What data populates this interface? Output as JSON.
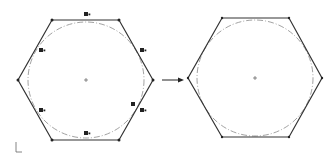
{
  "diagram": {
    "description": "Sketch: hexagon with inscribed construction circle and relation markers, arrow, resulting hexagon",
    "colors": {
      "edge": "#333333",
      "construction_circle": "#888888",
      "vertex": "#222222",
      "marker": "#222222"
    },
    "left_sketch": {
      "label": "Sketch with relations shown",
      "center": [
        86,
        80
      ],
      "vertices": [
        [
          52,
          20
        ],
        [
          119,
          20
        ],
        [
          153,
          80
        ],
        [
          119,
          140
        ],
        [
          52,
          140
        ],
        [
          18,
          80
        ]
      ],
      "circle_radius": 58,
      "relation_markers": [
        {
          "x": 84,
          "y": 12,
          "name": "tangent-marker"
        },
        {
          "x": 40,
          "y": 48,
          "name": "tangent-marker"
        },
        {
          "x": 141,
          "y": 48,
          "name": "tangent-marker"
        },
        {
          "x": 40,
          "y": 108,
          "name": "tangent-marker"
        },
        {
          "x": 131,
          "y": 102,
          "name": "tangent-marker"
        },
        {
          "x": 141,
          "y": 108,
          "name": "tangent-marker"
        },
        {
          "x": 84,
          "y": 132,
          "name": "tangent-marker"
        }
      ]
    },
    "right_sketch": {
      "label": "Result sketch",
      "center": [
        255,
        78
      ],
      "vertices": [
        [
          222,
          18
        ],
        [
          289,
          18
        ],
        [
          322,
          78
        ],
        [
          289,
          137
        ],
        [
          222,
          137
        ],
        [
          188,
          78
        ]
      ],
      "circle_radius": 58
    },
    "arrow": {
      "from": [
        162,
        80
      ],
      "to": [
        183,
        80
      ],
      "label": "transforms to"
    }
  }
}
